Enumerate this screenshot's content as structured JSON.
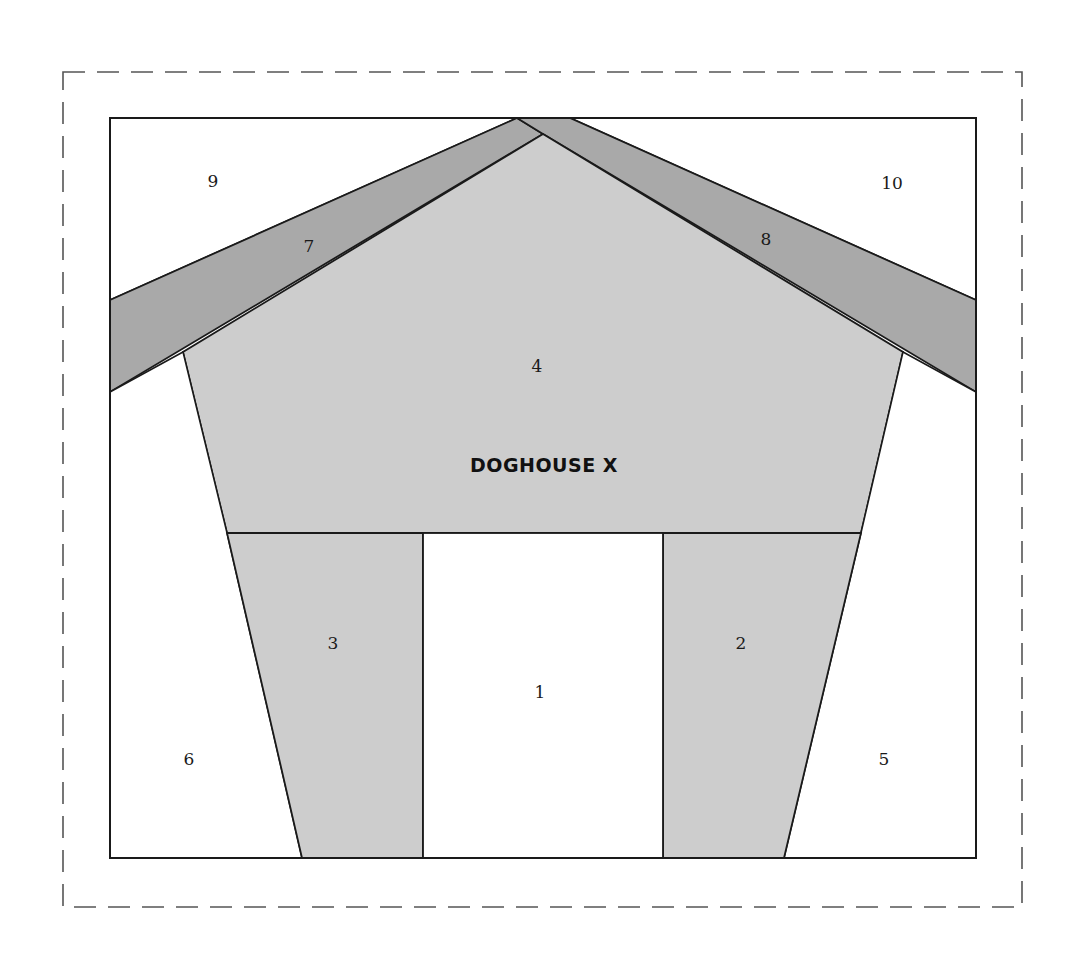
{
  "diagram": {
    "title": "DOGHOUSE X",
    "colors": {
      "roof": "#a9a9a9",
      "body": "#cdcdcd",
      "background": "#ffffff",
      "stroke": "#1a1a1a",
      "dashed_border": "#555555"
    },
    "pieces": [
      {
        "id": "1",
        "label": "1",
        "name": "door-opening"
      },
      {
        "id": "2",
        "label": "2",
        "name": "right-wall"
      },
      {
        "id": "3",
        "label": "3",
        "name": "left-wall"
      },
      {
        "id": "4",
        "label": "4",
        "name": "gable-front"
      },
      {
        "id": "5",
        "label": "5",
        "name": "right-background-lower"
      },
      {
        "id": "6",
        "label": "6",
        "name": "left-background-lower"
      },
      {
        "id": "7",
        "label": "7",
        "name": "left-roof"
      },
      {
        "id": "8",
        "label": "8",
        "name": "right-roof"
      },
      {
        "id": "9",
        "label": "9",
        "name": "left-sky"
      },
      {
        "id": "10",
        "label": "10",
        "name": "right-sky"
      }
    ]
  }
}
